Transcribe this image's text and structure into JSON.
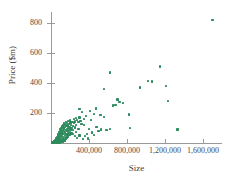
{
  "chart_data": {
    "type": "scatter",
    "title": "",
    "xlabel": "Size",
    "ylabel": "Price ($m)",
    "xlim": [
      0,
      1800000
    ],
    "ylim": [
      0,
      880
    ],
    "grid": false,
    "legend": null,
    "marker_color": "#2e8b5e",
    "axis_color": "#9a9a9a",
    "xticks": [
      400000,
      800000,
      1200000,
      1600000
    ],
    "xtick_labels": [
      "400,000",
      "800,000",
      "1,200,000",
      "1,600,000"
    ],
    "yticks": [
      200,
      400,
      600,
      800
    ],
    "ytick_labels": [
      "200",
      "400",
      "600",
      "800"
    ],
    "series_name": "properties",
    "n_points": 196,
    "points": [
      [
        1700000,
        820
      ],
      [
        1150000,
        510
      ],
      [
        620000,
        470
      ],
      [
        1020000,
        415
      ],
      [
        1060000,
        410
      ],
      [
        1210000,
        380
      ],
      [
        940000,
        370
      ],
      [
        560000,
        360
      ],
      [
        1230000,
        280
      ],
      [
        700000,
        290
      ],
      [
        720000,
        275
      ],
      [
        760000,
        265
      ],
      [
        680000,
        255
      ],
      [
        650000,
        250
      ],
      [
        820000,
        190
      ],
      [
        470000,
        230
      ],
      [
        300000,
        225
      ],
      [
        410000,
        215
      ],
      [
        330000,
        205
      ],
      [
        450000,
        195
      ],
      [
        520000,
        185
      ],
      [
        370000,
        180
      ],
      [
        560000,
        175
      ],
      [
        300000,
        170
      ],
      [
        260000,
        165
      ],
      [
        350000,
        160
      ],
      [
        240000,
        158
      ],
      [
        420000,
        155
      ],
      [
        275000,
        152
      ],
      [
        200000,
        150
      ],
      [
        310000,
        148
      ],
      [
        180000,
        146
      ],
      [
        255000,
        144
      ],
      [
        225000,
        142
      ],
      [
        160000,
        140
      ],
      [
        290000,
        138
      ],
      [
        205000,
        136
      ],
      [
        170000,
        134
      ],
      [
        240000,
        132
      ],
      [
        140000,
        130
      ],
      [
        320000,
        128
      ],
      [
        190000,
        126
      ],
      [
        150000,
        124
      ],
      [
        265000,
        122
      ],
      [
        210000,
        120
      ],
      [
        130000,
        118
      ],
      [
        175000,
        116
      ],
      [
        230000,
        114
      ],
      [
        160000,
        112
      ],
      [
        120000,
        110
      ],
      [
        195000,
        108
      ],
      [
        145000,
        106
      ],
      [
        250000,
        104
      ],
      [
        185000,
        102
      ],
      [
        110000,
        100
      ],
      [
        215000,
        98
      ],
      [
        135000,
        96
      ],
      [
        165000,
        94
      ],
      [
        290000,
        95
      ],
      [
        100000,
        92
      ],
      [
        205000,
        90
      ],
      [
        155000,
        88
      ],
      [
        125000,
        86
      ],
      [
        180000,
        84
      ],
      [
        95000,
        82
      ],
      [
        235000,
        86
      ],
      [
        140000,
        80
      ],
      [
        170000,
        78
      ],
      [
        110000,
        76
      ],
      [
        200000,
        74
      ],
      [
        88000,
        72
      ],
      [
        150000,
        70
      ],
      [
        260000,
        74
      ],
      [
        130000,
        68
      ],
      [
        185000,
        66
      ],
      [
        100000,
        64
      ],
      [
        160000,
        62
      ],
      [
        80000,
        60
      ],
      [
        215000,
        64
      ],
      [
        120000,
        58
      ],
      [
        175000,
        56
      ],
      [
        92000,
        54
      ],
      [
        145000,
        52
      ],
      [
        72000,
        50
      ],
      [
        195000,
        54
      ],
      [
        112000,
        48
      ],
      [
        165000,
        46
      ],
      [
        85000,
        44
      ],
      [
        135000,
        42
      ],
      [
        65000,
        40
      ],
      [
        180000,
        44
      ],
      [
        105000,
        38
      ],
      [
        155000,
        36
      ],
      [
        78000,
        34
      ],
      [
        128000,
        32
      ],
      [
        58000,
        30
      ],
      [
        170000,
        34
      ],
      [
        98000,
        28
      ],
      [
        148000,
        27
      ],
      [
        70000,
        26
      ],
      [
        120000,
        25
      ],
      [
        52000,
        24
      ],
      [
        160000,
        26
      ],
      [
        90000,
        23
      ],
      [
        140000,
        22
      ],
      [
        64000,
        21
      ],
      [
        112000,
        20
      ],
      [
        46000,
        19
      ],
      [
        150000,
        21
      ],
      [
        82000,
        18
      ],
      [
        132000,
        17
      ],
      [
        58000,
        17
      ],
      [
        104000,
        16
      ],
      [
        40000,
        15
      ],
      [
        142000,
        16
      ],
      [
        75000,
        15
      ],
      [
        124000,
        14
      ],
      [
        52000,
        14
      ],
      [
        96000,
        13
      ],
      [
        35000,
        13
      ],
      [
        134000,
        13
      ],
      [
        68000,
        12
      ],
      [
        116000,
        12
      ],
      [
        46000,
        12
      ],
      [
        88000,
        11
      ],
      [
        30000,
        11
      ],
      [
        126000,
        11
      ],
      [
        62000,
        10
      ],
      [
        108000,
        10
      ],
      [
        42000,
        10
      ],
      [
        80000,
        9
      ],
      [
        26000,
        9
      ],
      [
        118000,
        9
      ],
      [
        56000,
        9
      ],
      [
        100000,
        8
      ],
      [
        38000,
        8
      ],
      [
        74000,
        8
      ],
      [
        22000,
        8
      ],
      [
        110000,
        7
      ],
      [
        50000,
        7
      ],
      [
        92000,
        7
      ],
      [
        34000,
        7
      ],
      [
        68000,
        6
      ],
      [
        19000,
        6
      ],
      [
        102000,
        6
      ],
      [
        45000,
        6
      ],
      [
        85000,
        6
      ],
      [
        30000,
        6
      ],
      [
        62000,
        5
      ],
      [
        16000,
        5
      ],
      [
        95000,
        5
      ],
      [
        41000,
        5
      ],
      [
        78000,
        5
      ],
      [
        27000,
        5
      ],
      [
        57000,
        4
      ],
      [
        14000,
        4
      ],
      [
        88000,
        4
      ],
      [
        37000,
        4
      ],
      [
        71000,
        4
      ],
      [
        24000,
        4
      ],
      [
        52000,
        3
      ],
      [
        12000,
        3
      ],
      [
        82000,
        3
      ],
      [
        33000,
        3
      ],
      [
        65000,
        3
      ],
      [
        21000,
        3
      ],
      [
        47000,
        3
      ],
      [
        10000,
        3
      ],
      [
        76000,
        2
      ],
      [
        29000,
        2
      ],
      [
        60000,
        2
      ],
      [
        18000,
        2
      ],
      [
        43000,
        2
      ],
      [
        8000,
        2
      ],
      [
        70000,
        2
      ],
      [
        26000,
        2
      ],
      [
        55000,
        2
      ],
      [
        15000,
        2
      ],
      [
        39000,
        2
      ],
      [
        380000,
        60
      ],
      [
        400000,
        95
      ],
      [
        345000,
        120
      ],
      [
        430000,
        70
      ],
      [
        360000,
        45
      ],
      [
        480000,
        105
      ],
      [
        390000,
        30
      ],
      [
        500000,
        80
      ],
      [
        340000,
        25
      ],
      [
        455000,
        55
      ],
      [
        530000,
        90
      ],
      [
        300000,
        50
      ],
      [
        585000,
        85
      ],
      [
        620000,
        95
      ],
      [
        830000,
        100
      ],
      [
        1330000,
        90
      ],
      [
        275000,
        35
      ],
      [
        250000,
        45
      ],
      [
        225000,
        60
      ]
    ]
  }
}
